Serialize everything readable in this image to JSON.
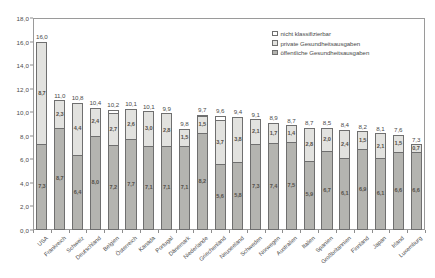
{
  "chart_data": {
    "type": "bar",
    "subtype": "stacked-bar",
    "title": "",
    "xlabel": "",
    "ylabel": "",
    "ylim": [
      0,
      18
    ],
    "ytick_step": 2,
    "ytick_labels": [
      "0,0",
      "2,0",
      "4,0",
      "6,0",
      "8,0",
      "10,0",
      "12,0",
      "14,0",
      "16,0",
      "18,0"
    ],
    "grid": false,
    "decimal_separator": ",",
    "legend_position": "top-right",
    "legend": [
      {
        "key": "unclassified",
        "label": "nicht klassifizierbar",
        "color": "#ffffff"
      },
      {
        "key": "private",
        "label": "private Gesundheitsausgaben",
        "color": "#e2e2df"
      },
      {
        "key": "public",
        "label": "öffentliche Gesundheitsausgaben",
        "color": "#b4b4b0"
      }
    ],
    "categories": [
      "USA",
      "Frankreich",
      "Schweiz",
      "Deutschland",
      "Belgien",
      "Österreich",
      "Kanada",
      "Portugal",
      "Dänemark",
      "Niederlande",
      "Griechenland",
      "Neuseeland",
      "Schweden",
      "Norwegen",
      "Australien",
      "Italien",
      "Spanien",
      "Großbritannien",
      "Finnland",
      "Japan",
      "Irland",
      "Luxemburg"
    ],
    "series": [
      {
        "name": "öffentliche Gesundheitsausgaben",
        "key": "public",
        "values": [
          7.3,
          8.7,
          6.4,
          8.0,
          7.2,
          7.7,
          7.1,
          7.1,
          7.1,
          8.2,
          5.6,
          5.8,
          7.3,
          7.4,
          7.5,
          5.9,
          6.7,
          6.1,
          6.9,
          6.1,
          6.6,
          6.6
        ]
      },
      {
        "name": "private Gesundheitsausgaben",
        "key": "private",
        "values": [
          8.7,
          2.3,
          4.4,
          2.4,
          2.7,
          2.6,
          3.0,
          2.8,
          1.5,
          1.5,
          3.7,
          3.8,
          2.1,
          1.7,
          1.4,
          2.8,
          2.0,
          2.4,
          1.5,
          2.1,
          1.5,
          0.7
        ]
      },
      {
        "name": "nicht klassifizierbar",
        "key": "unclassified",
        "values": [
          0.0,
          0.0,
          0.0,
          0.0,
          0.3,
          0.0,
          0.0,
          0.0,
          0.0,
          0.1,
          0.4,
          0.0,
          0.0,
          0.0,
          0.0,
          0.0,
          0.0,
          0.0,
          0.0,
          0.0,
          0.0,
          0.0
        ]
      }
    ],
    "totals": [
      16.0,
      11.0,
      10.8,
      10.4,
      10.2,
      10.1,
      10.1,
      9.9,
      9.8,
      9.7,
      9.6,
      9.4,
      9.1,
      8.9,
      8.7,
      8.7,
      8.5,
      8.4,
      8.2,
      8.1,
      7.6,
      7.3
    ],
    "total_labels": [
      "16,0",
      "11,0",
      "10,8",
      "10,4",
      "10,2",
      "10,1",
      "10,1",
      "9,9",
      "9,8",
      "9,7",
      "9,6",
      "9,4",
      "9,1",
      "8,9",
      "8,7",
      "8,7",
      "8,5",
      "8,4",
      "8,2",
      "8,1",
      "7,6",
      "7,3"
    ],
    "public_labels": [
      "7,3",
      "8,7",
      "6,4",
      "8,0",
      "7,2",
      "7,7",
      "7,1",
      "7,1",
      "7,1",
      "8,2",
      "5,6",
      "5,8",
      "7,3",
      "7,4",
      "7,5",
      "5,9",
      "6,7",
      "6,1",
      "6,9",
      "6,1",
      "6,6",
      "6,6"
    ],
    "private_labels": [
      "8,7",
      "2,3",
      "4,4",
      "2,4",
      "2,7",
      "2,6",
      "3,0",
      "2,8",
      "1,5",
      "1,5",
      "3,7",
      "3,8",
      "2,1",
      "1,7",
      "1,4",
      "2,8",
      "2,0",
      "2,4",
      "1,5",
      "2,1",
      "1,5",
      "0,7"
    ]
  }
}
